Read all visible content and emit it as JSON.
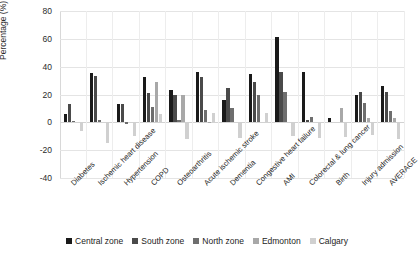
{
  "chart_data": {
    "type": "bar",
    "title": "",
    "xlabel": "",
    "ylabel": "Percentage (%)",
    "ylim": [
      -40,
      80
    ],
    "yticks": [
      80,
      60,
      40,
      20,
      0,
      -20,
      -40
    ],
    "grid": true,
    "legend_position": "bottom",
    "categories": [
      "Diabetes",
      "Ischemic heart disease",
      "Hypertension",
      "COPD",
      "Osteoarthritis",
      "Acute ischemic stroke",
      "Dementia",
      "Congestive heart failure",
      "AMI",
      "Colorectal & lung cancer",
      "Birth",
      "Injury admission",
      "AVERAGE"
    ],
    "series": [
      {
        "name": "Central zone",
        "color": "#1a1a1a",
        "values": [
          6,
          35.5,
          13,
          32.5,
          23,
          36,
          16,
          35,
          61,
          36.5,
          3,
          20,
          26
        ]
      },
      {
        "name": "South zone",
        "color": "#4a4a4a",
        "values": [
          13,
          33,
          13,
          21,
          20,
          32.5,
          24.5,
          29,
          36,
          2,
          0,
          22,
          22
        ]
      },
      {
        "name": "North zone",
        "color": "#6e6e6e",
        "values": [
          1,
          2,
          -1.5,
          11,
          2,
          9,
          10,
          19.5,
          22,
          3.5,
          0,
          14,
          8
        ]
      },
      {
        "name": "Edmonton",
        "color": "#a8a8a8",
        "values": [
          0,
          0,
          0,
          29,
          20,
          0.5,
          0,
          0,
          0,
          0,
          10.5,
          3,
          3
        ]
      },
      {
        "name": "Calgary",
        "color": "#d0d0d0",
        "values": [
          -6.5,
          -15,
          -10,
          6,
          -12,
          7,
          -11,
          6.5,
          -9.5,
          -11.5,
          -10.5,
          -9,
          -12
        ]
      }
    ]
  },
  "legend": {
    "items": [
      {
        "label": "Central zone",
        "color": "#1a1a1a"
      },
      {
        "label": "South zone",
        "color": "#4a4a4a"
      },
      {
        "label": "North zone",
        "color": "#6e6e6e"
      },
      {
        "label": "Edmonton",
        "color": "#a8a8a8"
      },
      {
        "label": "Calgary",
        "color": "#d0d0d0"
      }
    ]
  }
}
